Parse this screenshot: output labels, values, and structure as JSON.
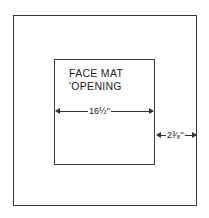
{
  "diagram": {
    "inner_label_line1": "FACE MAT",
    "inner_label_line2": "'OPENING",
    "opening_width": "16½''",
    "border_width": "2³⁄₈''",
    "colors": {
      "line": "#3a3a3a",
      "background": "#ffffff"
    }
  }
}
